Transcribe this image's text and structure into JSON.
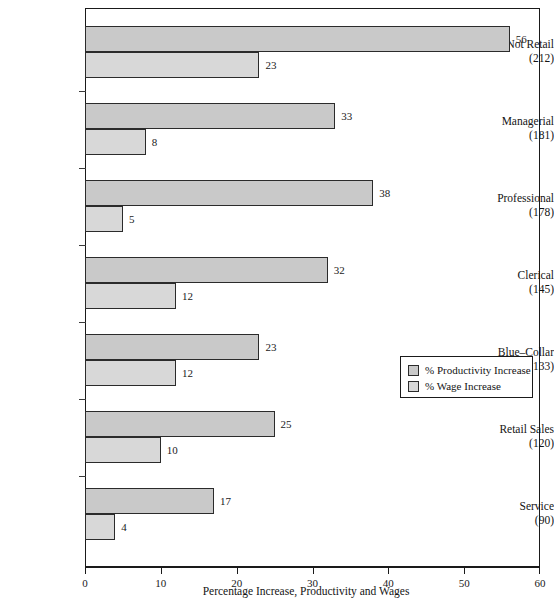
{
  "top_crumb": "",
  "chart_data": {
    "type": "bar",
    "orientation": "horizontal",
    "title": "",
    "xlabel": "Percentage Increase, Productivity and Wages",
    "ylabel": "",
    "xlim": [
      0,
      60
    ],
    "xticks": [
      0,
      10,
      20,
      30,
      40,
      50,
      60
    ],
    "xtick_labels": [
      "0",
      "10",
      "20",
      "30",
      "40",
      "50",
      "60"
    ],
    "grid": false,
    "legend_position": "center-right",
    "categories": [
      "Sales, Not Retail",
      "Managerial",
      "Professional",
      "Clerical",
      "Blue–Collar",
      "Retail Sales",
      "Service"
    ],
    "category_counts": [
      "(212)",
      "(181)",
      "(178)",
      "(145)",
      "(133)",
      "(120)",
      "(90)"
    ],
    "series": [
      {
        "name": "% Productivity Increase",
        "color": "#c9c9c9",
        "values": [
          56,
          33,
          38,
          32,
          23,
          25,
          17
        ]
      },
      {
        "name": "% Wage Increase",
        "color": "#d8d8d8",
        "values": [
          23,
          8,
          5,
          12,
          12,
          10,
          4
        ]
      }
    ]
  },
  "legend": {
    "items": [
      {
        "label": "% Productivity Increase",
        "swatch": "#c9c9c9"
      },
      {
        "label": "% Wage Increase",
        "swatch": "#d8d8d8"
      }
    ]
  },
  "colors": {
    "productivity_bar": "#c9c9c9",
    "wage_bar": "#d8d8d8",
    "bar_border": "#2b2b2b",
    "axis": "#1a1a1a",
    "background": "#ffffff"
  }
}
